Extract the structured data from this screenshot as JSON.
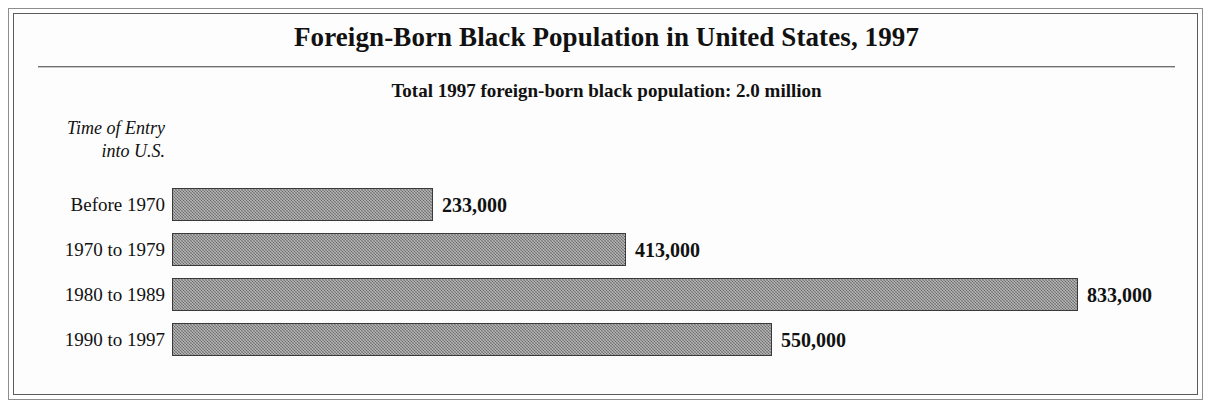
{
  "chart_data": {
    "type": "bar",
    "orientation": "horizontal",
    "title": "Foreign-Born Black Population in United States, 1997",
    "subtitle": "Total 1997 foreign-born black population: 2.0 million",
    "ylabel": "Time of Entry\ninto U.S.",
    "ylabel_lines": [
      "Time of Entry",
      "into U.S."
    ],
    "xlabel": "",
    "categories": [
      "Before 1970",
      "1970 to 1979",
      "1980 to 1989",
      "1990 to 1997"
    ],
    "values": [
      233000,
      413000,
      833000,
      550000
    ],
    "value_labels": [
      "233,000",
      "413,000",
      "833,000",
      "550,000"
    ],
    "xlim": [
      0,
      833000
    ],
    "grid": false,
    "legend": false,
    "bar_color": "#878787",
    "bar_outline_color": "#3a3a3a"
  },
  "bars": [
    {
      "category": "Before 1970",
      "value": 233000,
      "label": "233,000",
      "width_px": 261
    },
    {
      "category": "1970 to 1979",
      "value": 413000,
      "label": "413,000",
      "width_px": 454
    },
    {
      "category": "1980 to 1989",
      "value": 833000,
      "label": "833,000",
      "width_px": 906
    },
    {
      "category": "1990 to 1997",
      "value": 550000,
      "label": "550,000",
      "width_px": 600
    }
  ],
  "colors": {
    "bar_fill": "#878787",
    "bar_outline": "#3a3a3a",
    "frame_outer": "#8d8d8d",
    "frame_inner": "#5b5b5b",
    "text": "#111111",
    "background": "#ffffff"
  }
}
